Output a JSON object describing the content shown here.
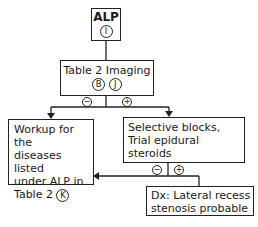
{
  "nodes": {
    "alp": {
      "title": "ALP",
      "marker": "I"
    },
    "imaging": {
      "title": "Table 2  Imaging",
      "markers": [
        "B",
        "J"
      ]
    },
    "workup": {
      "lines": [
        "Workup for the",
        "diseases listed",
        "under ALP in",
        "Table 2"
      ],
      "marker": "K"
    },
    "blocks": {
      "lines": [
        "Selective blocks,",
        "Trial epidural",
        "steroids"
      ]
    },
    "dx": {
      "lines": [
        "Dx:  Lateral recess",
        "stenosis probable"
      ]
    }
  },
  "edges": {
    "imaging_negative": "−",
    "imaging_positive": "+",
    "blocks_negative": "−",
    "blocks_positive": "+"
  }
}
